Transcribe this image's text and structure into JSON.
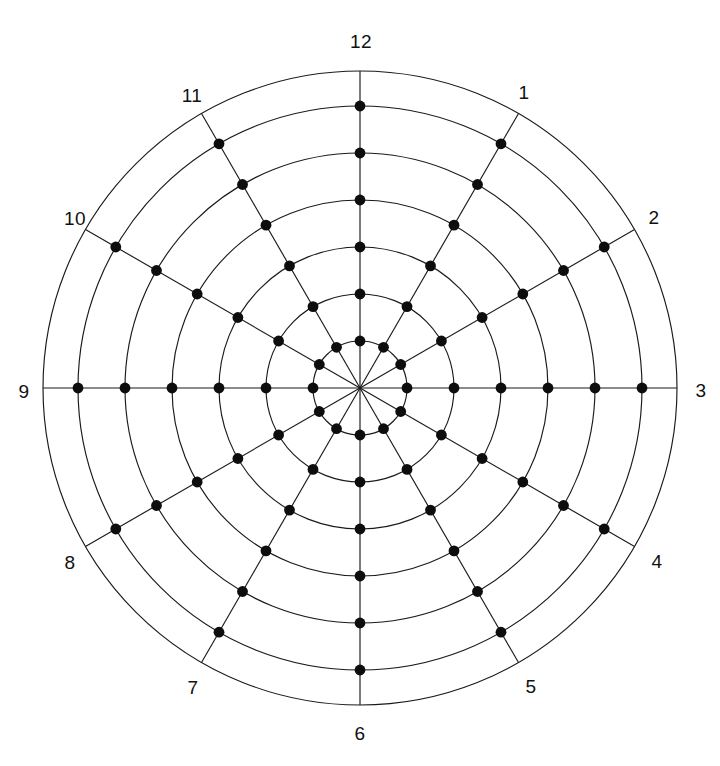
{
  "chart_data": {
    "type": "scatter",
    "title": "",
    "subtitle": "",
    "xlabel": "",
    "ylabel": "",
    "coordinate_system": "polar",
    "grid": true,
    "legend": false,
    "legend_position": "none",
    "background_color": "#ffffff",
    "line_color": "#1a1a1a",
    "node_color": "#0d0d0d",
    "label_color": "#111111",
    "center": {
      "x": 360,
      "y": 388
    },
    "angular_axis": {
      "name": "clock-hours",
      "units": "hour",
      "tick_count": 12,
      "tick_labels": [
        "12",
        "1",
        "2",
        "3",
        "4",
        "5",
        "6",
        "7",
        "8",
        "9",
        "10",
        "11"
      ],
      "tick_angles_deg": [
        0,
        30,
        60,
        90,
        120,
        150,
        180,
        210,
        240,
        270,
        300,
        330
      ],
      "zero_at": "top",
      "direction": "clockwise"
    },
    "radial_axis": {
      "ring_count": 7,
      "ring_radii_px": [
        47,
        94,
        141,
        188,
        235,
        282,
        317
      ],
      "rings_with_nodes": [
        1,
        2,
        3,
        4,
        5,
        6
      ],
      "outer_ring_index": 7,
      "rmin": 0,
      "rmax": 7
    },
    "nodes": {
      "count": 72,
      "radius_px": 5.4,
      "rings": [
        1,
        2,
        3,
        4,
        5,
        6
      ],
      "spokes": [
        12,
        1,
        2,
        3,
        4,
        5,
        6,
        7,
        8,
        9,
        10,
        11
      ],
      "description": "One filled dot at every intersection of the 12 spokes with rings 1 through 6"
    },
    "labels": [
      {
        "text": "12",
        "hour": 12,
        "angle_deg": 0,
        "x": 361,
        "y": 41
      },
      {
        "text": "1",
        "hour": 1,
        "angle_deg": 30,
        "x": 524,
        "y": 92
      },
      {
        "text": "2",
        "hour": 2,
        "angle_deg": 60,
        "x": 654,
        "y": 217
      },
      {
        "text": "3",
        "hour": 3,
        "angle_deg": 90,
        "x": 701,
        "y": 390
      },
      {
        "text": "4",
        "hour": 4,
        "angle_deg": 120,
        "x": 657,
        "y": 561
      },
      {
        "text": "5",
        "hour": 5,
        "angle_deg": 150,
        "x": 531,
        "y": 686
      },
      {
        "text": "6",
        "hour": 6,
        "angle_deg": 180,
        "x": 360,
        "y": 733
      },
      {
        "text": "7",
        "hour": 7,
        "angle_deg": 210,
        "x": 193,
        "y": 687
      },
      {
        "text": "8",
        "hour": 8,
        "angle_deg": 240,
        "x": 70,
        "y": 562
      },
      {
        "text": "9",
        "hour": 9,
        "angle_deg": 270,
        "x": 24,
        "y": 391
      },
      {
        "text": "10",
        "hour": 10,
        "angle_deg": 300,
        "x": 75,
        "y": 218
      },
      {
        "text": "11",
        "hour": 11,
        "angle_deg": 330,
        "x": 192,
        "y": 95
      }
    ]
  }
}
